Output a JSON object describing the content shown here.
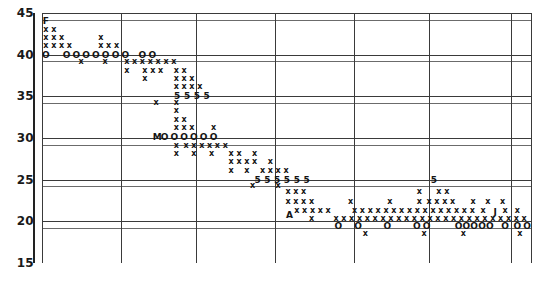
{
  "chart": {
    "title": "",
    "xlabel": "",
    "ylabel": "",
    "ylabels": [
      "45",
      "40",
      "35",
      "30",
      "25",
      "20",
      "15"
    ]
  },
  "chart_data": {
    "type": "scatter",
    "title": "",
    "subtitle": "",
    "xlabel": "",
    "ylabel": "",
    "xlim": [
      0,
      100
    ],
    "ylim": [
      15,
      45
    ],
    "yticks": [
      45,
      40,
      35,
      30,
      25,
      20,
      15
    ],
    "ytick_labels": [
      "45",
      "40",
      "35",
      "30",
      "25",
      "20",
      "15"
    ],
    "xticks": [],
    "xtick_labels": [],
    "grid": "both",
    "grid_vertical_x": [
      0,
      16.1,
      31.4,
      47.5,
      63.6,
      78.9,
      95.8
    ],
    "grid_horizontal_y": [
      45,
      44.2,
      40,
      39.2,
      35,
      34.2,
      30,
      29.2,
      25,
      24.2,
      20,
      19.2,
      15
    ],
    "legend": [],
    "annotations": [
      {
        "label": "F",
        "x": 0.8,
        "y": 44.0
      },
      {
        "label": "M",
        "x": 23.5,
        "y": 30.1
      },
      {
        "label": "A",
        "x": 50.5,
        "y": 20.8
      },
      {
        "label": "J",
        "x": 92.5,
        "y": 21.1
      }
    ],
    "markers": {
      "x": "x",
      "o": "O",
      "five": "5",
      "letter": "letter"
    },
    "series": [
      {
        "name": "x-markers",
        "marker": "x",
        "points": [
          [
            0.8,
            43.0
          ],
          [
            2.4,
            43.0
          ],
          [
            0.8,
            42.0
          ],
          [
            2.4,
            42.0
          ],
          [
            4.0,
            42.0
          ],
          [
            12.0,
            42.0
          ],
          [
            0.8,
            41.0
          ],
          [
            2.4,
            41.0
          ],
          [
            4.0,
            41.0
          ],
          [
            5.6,
            41.0
          ],
          [
            12.0,
            41.0
          ],
          [
            13.6,
            41.0
          ],
          [
            15.2,
            41.0
          ],
          [
            8.0,
            39.1
          ],
          [
            12.9,
            39.1
          ],
          [
            17.3,
            39.1
          ],
          [
            18.9,
            39.1
          ],
          [
            20.5,
            39.1
          ],
          [
            22.1,
            39.1
          ],
          [
            23.7,
            39.1
          ],
          [
            25.3,
            39.1
          ],
          [
            26.9,
            39.1
          ],
          [
            17.3,
            38.1
          ],
          [
            21.0,
            38.1
          ],
          [
            22.6,
            38.1
          ],
          [
            24.2,
            38.1
          ],
          [
            27.4,
            38.1
          ],
          [
            29.0,
            38.1
          ],
          [
            21.0,
            37.1
          ],
          [
            27.4,
            37.1
          ],
          [
            29.0,
            37.1
          ],
          [
            30.6,
            37.1
          ],
          [
            27.4,
            36.1
          ],
          [
            29.0,
            36.1
          ],
          [
            30.6,
            36.1
          ],
          [
            32.2,
            36.1
          ],
          [
            23.3,
            34.2
          ],
          [
            27.4,
            34.2
          ],
          [
            27.4,
            33.2
          ],
          [
            27.4,
            32.2
          ],
          [
            29.0,
            32.2
          ],
          [
            27.4,
            31.2
          ],
          [
            29.0,
            31.2
          ],
          [
            30.6,
            31.2
          ],
          [
            35.0,
            31.2
          ],
          [
            27.4,
            29.1
          ],
          [
            29.4,
            29.1
          ],
          [
            31.0,
            29.1
          ],
          [
            32.6,
            29.1
          ],
          [
            34.2,
            29.1
          ],
          [
            35.8,
            29.1
          ],
          [
            37.4,
            29.1
          ],
          [
            27.4,
            28.1
          ],
          [
            31.0,
            28.1
          ],
          [
            34.6,
            28.1
          ],
          [
            38.6,
            28.1
          ],
          [
            40.2,
            28.1
          ],
          [
            43.4,
            28.1
          ],
          [
            38.6,
            27.1
          ],
          [
            40.2,
            27.1
          ],
          [
            41.8,
            27.1
          ],
          [
            43.4,
            27.1
          ],
          [
            46.6,
            27.1
          ],
          [
            38.6,
            26.1
          ],
          [
            41.8,
            26.1
          ],
          [
            45.0,
            26.1
          ],
          [
            46.6,
            26.1
          ],
          [
            48.2,
            26.1
          ],
          [
            49.8,
            26.1
          ],
          [
            43.0,
            24.2
          ],
          [
            48.2,
            24.2
          ],
          [
            50.2,
            23.5
          ],
          [
            51.8,
            23.5
          ],
          [
            53.4,
            23.5
          ],
          [
            77.0,
            23.5
          ],
          [
            81.0,
            23.5
          ],
          [
            82.6,
            23.5
          ],
          [
            50.2,
            22.3
          ],
          [
            51.8,
            22.3
          ],
          [
            53.4,
            22.3
          ],
          [
            55.0,
            22.3
          ],
          [
            63.0,
            22.3
          ],
          [
            71.0,
            22.3
          ],
          [
            77.0,
            22.3
          ],
          [
            79.0,
            22.3
          ],
          [
            80.6,
            22.3
          ],
          [
            82.2,
            22.3
          ],
          [
            83.8,
            22.3
          ],
          [
            88.0,
            22.3
          ],
          [
            91.0,
            22.3
          ],
          [
            94.0,
            22.3
          ],
          [
            52.0,
            21.3
          ],
          [
            53.6,
            21.3
          ],
          [
            55.2,
            21.3
          ],
          [
            56.8,
            21.3
          ],
          [
            58.4,
            21.3
          ],
          [
            63.8,
            21.3
          ],
          [
            65.4,
            21.3
          ],
          [
            67.0,
            21.3
          ],
          [
            68.6,
            21.3
          ],
          [
            70.2,
            21.3
          ],
          [
            71.8,
            21.3
          ],
          [
            73.4,
            21.3
          ],
          [
            75.0,
            21.3
          ],
          [
            76.6,
            21.3
          ],
          [
            78.2,
            21.3
          ],
          [
            79.8,
            21.3
          ],
          [
            81.4,
            21.3
          ],
          [
            83.0,
            21.3
          ],
          [
            84.6,
            21.3
          ],
          [
            86.2,
            21.3
          ],
          [
            87.8,
            21.3
          ],
          [
            90.0,
            21.3
          ],
          [
            94.5,
            21.3
          ],
          [
            97.0,
            21.3
          ],
          [
            55.0,
            20.3
          ],
          [
            60.0,
            20.3
          ],
          [
            61.6,
            20.3
          ],
          [
            63.2,
            20.3
          ],
          [
            64.8,
            20.3
          ],
          [
            66.4,
            20.3
          ],
          [
            68.0,
            20.3
          ],
          [
            69.6,
            20.3
          ],
          [
            71.2,
            20.3
          ],
          [
            72.8,
            20.3
          ],
          [
            74.4,
            20.3
          ],
          [
            76.0,
            20.3
          ],
          [
            77.6,
            20.3
          ],
          [
            79.2,
            20.3
          ],
          [
            80.8,
            20.3
          ],
          [
            82.4,
            20.3
          ],
          [
            84.0,
            20.3
          ],
          [
            85.6,
            20.3
          ],
          [
            87.2,
            20.3
          ],
          [
            88.8,
            20.3
          ],
          [
            90.4,
            20.3
          ],
          [
            92.0,
            20.3
          ],
          [
            93.6,
            20.3
          ],
          [
            95.2,
            20.3
          ],
          [
            96.8,
            20.3
          ],
          [
            98.4,
            20.3
          ],
          [
            66.0,
            18.5
          ],
          [
            78.0,
            18.5
          ],
          [
            86.0,
            18.5
          ],
          [
            97.5,
            18.5
          ]
        ]
      },
      {
        "name": "o-markers",
        "marker": "O",
        "points": [
          [
            0.8,
            40.0
          ],
          [
            5.0,
            40.0
          ],
          [
            7.0,
            40.0
          ],
          [
            9.0,
            40.0
          ],
          [
            11.0,
            40.0
          ],
          [
            13.0,
            40.0
          ],
          [
            15.0,
            40.0
          ],
          [
            17.0,
            40.0
          ],
          [
            20.5,
            40.0
          ],
          [
            22.5,
            40.0
          ],
          [
            25.0,
            30.1
          ],
          [
            27.0,
            30.1
          ],
          [
            29.0,
            30.1
          ],
          [
            31.0,
            30.1
          ],
          [
            33.0,
            30.1
          ],
          [
            35.0,
            30.1
          ],
          [
            60.5,
            19.5
          ],
          [
            64.5,
            19.5
          ],
          [
            70.5,
            19.5
          ],
          [
            76.5,
            19.5
          ],
          [
            78.5,
            19.5
          ],
          [
            85.0,
            19.5
          ],
          [
            86.6,
            19.5
          ],
          [
            88.2,
            19.5
          ],
          [
            89.8,
            19.5
          ],
          [
            91.4,
            19.5
          ],
          [
            94.5,
            19.5
          ],
          [
            97.0,
            19.5
          ],
          [
            99.0,
            19.5
          ]
        ]
      },
      {
        "name": "five-markers",
        "marker": "5",
        "points": [
          [
            27.6,
            35.0
          ],
          [
            29.6,
            35.0
          ],
          [
            31.6,
            35.0
          ],
          [
            33.6,
            35.0
          ],
          [
            44.0,
            25.0
          ],
          [
            46.0,
            25.0
          ],
          [
            48.0,
            25.0
          ],
          [
            50.0,
            25.0
          ],
          [
            52.0,
            25.0
          ],
          [
            54.0,
            25.0
          ],
          [
            80.0,
            25.0
          ]
        ]
      }
    ]
  }
}
